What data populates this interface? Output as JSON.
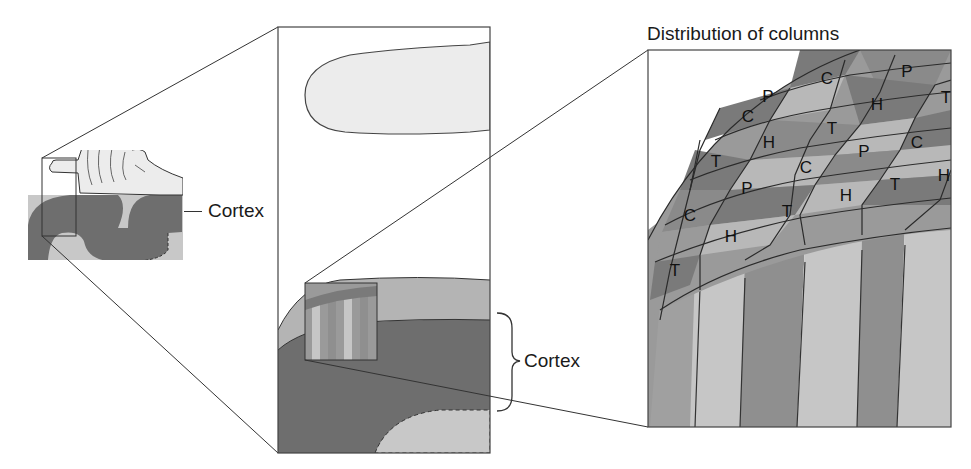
{
  "figure": {
    "left_panel": {
      "label": "Cortex"
    },
    "middle_panel": {
      "label": "Cortex"
    },
    "right_panel": {
      "title": "Distribution of columns",
      "column_letters": [
        {
          "letter": "C",
          "x": 827,
          "y": 80
        },
        {
          "letter": "P",
          "x": 907,
          "y": 73
        },
        {
          "letter": "P",
          "x": 768,
          "y": 98
        },
        {
          "letter": "H",
          "x": 877,
          "y": 106
        },
        {
          "letter": "T",
          "x": 946,
          "y": 99
        },
        {
          "letter": "C",
          "x": 748,
          "y": 118
        },
        {
          "letter": "T",
          "x": 832,
          "y": 130
        },
        {
          "letter": "H",
          "x": 769,
          "y": 144
        },
        {
          "letter": "P",
          "x": 864,
          "y": 153
        },
        {
          "letter": "C",
          "x": 917,
          "y": 144
        },
        {
          "letter": "T",
          "x": 716,
          "y": 163
        },
        {
          "letter": "C",
          "x": 806,
          "y": 169
        },
        {
          "letter": "P",
          "x": 747,
          "y": 190
        },
        {
          "letter": "T",
          "x": 895,
          "y": 186
        },
        {
          "letter": "H",
          "x": 944,
          "y": 177
        },
        {
          "letter": "C",
          "x": 690,
          "y": 217
        },
        {
          "letter": "T",
          "x": 787,
          "y": 213
        },
        {
          "letter": "H",
          "x": 846,
          "y": 197
        },
        {
          "letter": "H",
          "x": 731,
          "y": 238
        },
        {
          "letter": "T",
          "x": 675,
          "y": 272
        }
      ],
      "legend_letters": [
        "C",
        "P",
        "H",
        "T"
      ]
    },
    "colors": {
      "cortex_dark": "#6e6e6e",
      "cortex_light": "#c8c8c8",
      "outer_band": "#b4b4b4",
      "skin": "#ececec",
      "stripe_dark": "#8f8f8f",
      "stripe_light": "#c6c6c6",
      "cell_darkest": "#7a7a7a",
      "cell_mid": "#9a9a9a",
      "cell_light": "#b8b8b8",
      "line": "#333333"
    }
  }
}
